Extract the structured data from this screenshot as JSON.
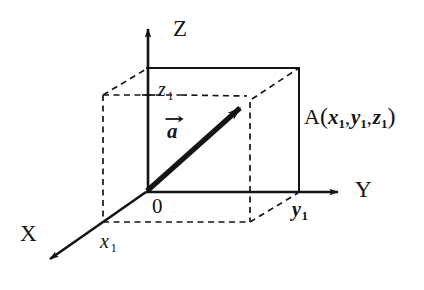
{
  "figure": {
    "type": "3d-coordinate-vector-diagram",
    "background_color": "#ffffff",
    "stroke_color": "#141414"
  },
  "axes": {
    "z": {
      "label": "Z",
      "direction": "up",
      "arrow": true
    },
    "y": {
      "label": "Y",
      "direction": "right",
      "arrow": true
    },
    "x": {
      "label": "X",
      "direction": "down-left",
      "arrow": true
    }
  },
  "origin": {
    "label": "0"
  },
  "vector": {
    "name": "a",
    "notation": "arrow-over",
    "from": "0",
    "to": "A"
  },
  "point": {
    "name": "A",
    "open_paren": "(",
    "close_paren": ")",
    "comma": ",",
    "coordinates": [
      {
        "var": "x",
        "sub": "1"
      },
      {
        "var": "y",
        "sub": "1"
      },
      {
        "var": "z",
        "sub": "1"
      }
    ]
  },
  "tick_labels": {
    "x1": {
      "var": "x",
      "sub": "1"
    },
    "y1": {
      "var": "y",
      "sub": "1"
    },
    "z1": {
      "var": "z",
      "sub": "1"
    }
  },
  "geometry": {
    "origin_px": [
      146,
      192
    ],
    "point_a_px": [
      250,
      100
    ],
    "front_face": [
      [
        148,
        68
      ],
      [
        299,
        68
      ],
      [
        299,
        192
      ],
      [
        146,
        192
      ]
    ],
    "back_left_x_px": 103,
    "back_bottom_y_px": 222,
    "projection_vertical_x_px": 250
  }
}
